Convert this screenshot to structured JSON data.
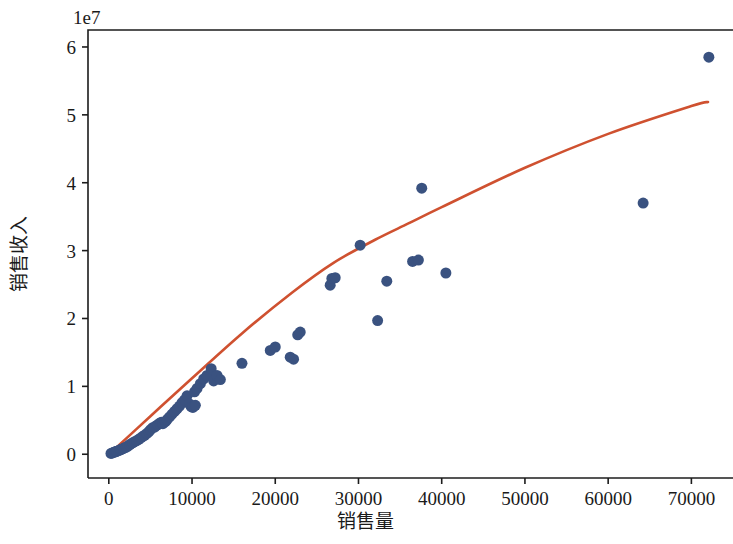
{
  "chart_data": {
    "type": "scatter",
    "title": "",
    "xlabel": "销售量",
    "ylabel": "销售收入",
    "y_offset_label": "1e7",
    "y_offset_multiplier": 10000000,
    "xlim": [
      -2500,
      75000
    ],
    "ylim": [
      -3500000,
      62500000
    ],
    "xticks": [
      0,
      10000,
      20000,
      30000,
      40000,
      50000,
      60000,
      70000
    ],
    "xticklabels": [
      "0",
      "10000",
      "20000",
      "30000",
      "40000",
      "50000",
      "60000",
      "70000"
    ],
    "yticks": [
      0,
      10000000,
      20000000,
      30000000,
      40000000,
      50000000,
      60000000
    ],
    "yticklabels": [
      "0",
      "1",
      "2",
      "3",
      "4",
      "5",
      "6"
    ],
    "grid": false,
    "legend": null,
    "series": [
      {
        "name": "销售数据点",
        "type": "scatter",
        "color": "#3a5280",
        "marker": "circle",
        "marker_size": 11,
        "points": [
          [
            260,
            120000
          ],
          [
            420,
            200000
          ],
          [
            560,
            260000
          ],
          [
            700,
            330000
          ],
          [
            850,
            400000
          ],
          [
            980,
            450000
          ],
          [
            1150,
            520000
          ],
          [
            1300,
            610000
          ],
          [
            1450,
            700000
          ],
          [
            1600,
            780000
          ],
          [
            1750,
            860000
          ],
          [
            1900,
            940000
          ],
          [
            2100,
            1050000
          ],
          [
            2300,
            1200000
          ],
          [
            2500,
            1400000
          ],
          [
            2700,
            1550000
          ],
          [
            2900,
            1700000
          ],
          [
            3100,
            1850000
          ],
          [
            3350,
            2000000
          ],
          [
            3600,
            2200000
          ],
          [
            3850,
            2400000
          ],
          [
            4050,
            2600000
          ],
          [
            4300,
            2800000
          ],
          [
            4550,
            3050000
          ],
          [
            4800,
            3300000
          ],
          [
            5000,
            3600000
          ],
          [
            5250,
            3900000
          ],
          [
            5500,
            4000000
          ],
          [
            5700,
            4200000
          ],
          [
            5900,
            4350000
          ],
          [
            6100,
            4550000
          ],
          [
            6300,
            4700000
          ],
          [
            6500,
            4500000
          ],
          [
            6800,
            4800000
          ],
          [
            7000,
            5100000
          ],
          [
            7300,
            5500000
          ],
          [
            7600,
            5900000
          ],
          [
            7900,
            6300000
          ],
          [
            8200,
            6700000
          ],
          [
            8500,
            7100000
          ],
          [
            8800,
            7600000
          ],
          [
            9100,
            8000000
          ],
          [
            9400,
            8600000
          ],
          [
            9700,
            7400000
          ],
          [
            9900,
            7000000
          ],
          [
            10100,
            6900000
          ],
          [
            10400,
            7200000
          ],
          [
            10300,
            9200000
          ],
          [
            10600,
            9700000
          ],
          [
            11000,
            10400000
          ],
          [
            11400,
            11100000
          ],
          [
            11800,
            11600000
          ],
          [
            12300,
            12600000
          ],
          [
            12600,
            10800000
          ],
          [
            13000,
            11600000
          ],
          [
            13400,
            11000000
          ],
          [
            16000,
            13400000
          ],
          [
            19400,
            15300000
          ],
          [
            20000,
            15800000
          ],
          [
            21800,
            14300000
          ],
          [
            22200,
            14000000
          ],
          [
            22700,
            17600000
          ],
          [
            23000,
            18000000
          ],
          [
            26600,
            24900000
          ],
          [
            26800,
            25900000
          ],
          [
            27200,
            26000000
          ],
          [
            30200,
            30800000
          ],
          [
            32300,
            19700000
          ],
          [
            33400,
            25500000
          ],
          [
            36500,
            28400000
          ],
          [
            37200,
            28600000
          ],
          [
            37600,
            39200000
          ],
          [
            40500,
            26700000
          ],
          [
            64200,
            37000000
          ],
          [
            72100,
            58500000
          ]
        ]
      },
      {
        "name": "拟合曲线",
        "type": "line",
        "color": "#cf5130",
        "linewidth": 2.6,
        "points": [
          [
            200,
            180000
          ],
          [
            5000,
            5600000
          ],
          [
            10000,
            11200000
          ],
          [
            16000,
            17800000
          ],
          [
            22000,
            23800000
          ],
          [
            27000,
            28200000
          ],
          [
            32000,
            31600000
          ],
          [
            36000,
            34000000
          ],
          [
            40000,
            36400000
          ],
          [
            50000,
            42200000
          ],
          [
            60000,
            47200000
          ],
          [
            70000,
            51300000
          ],
          [
            72000,
            51900000
          ]
        ]
      }
    ]
  },
  "axes": {
    "x_axis_name": "销售量",
    "y_axis_name": "销售收入",
    "offset_text": "1e7"
  }
}
